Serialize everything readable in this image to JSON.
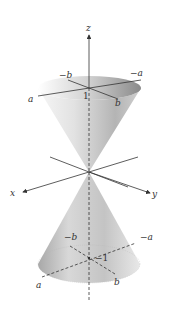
{
  "figure": {
    "axes": {
      "z_label": "z",
      "x_label": "x",
      "y_label": "y"
    },
    "top_section": {
      "label_neg_b": "−b",
      "label_neg_a": "−a",
      "label_a": "a",
      "label_b": "b",
      "label_level": "1"
    },
    "bottom_section": {
      "label_neg_b": "−b",
      "label_neg_a": "−a",
      "label_a": "a",
      "label_b": "b",
      "label_level": "−1"
    },
    "colors": {
      "cone_light": "#f4f4f4",
      "cone_mid": "#c8c8c8",
      "cone_dark": "#8c8c8c",
      "axis": "#333333"
    }
  }
}
